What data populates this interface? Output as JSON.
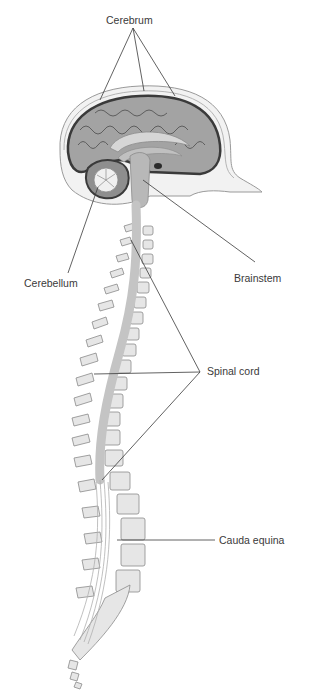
{
  "diagram": {
    "labels": {
      "cerebrum": "Cerebrum",
      "cerebellum": "Cerebellum",
      "brainstem": "Brainstem",
      "spinal_cord": "Spinal cord",
      "cauda_equina": "Cauda equina"
    },
    "colors": {
      "background": "#ffffff",
      "line": "#3a3a3a",
      "brain_gray": "#9a9a9a",
      "brain_light": "#c8c8c8",
      "bone": "#e6e6e6",
      "bone_edge": "#8a8a8a",
      "cord": "#c4c4c4"
    }
  }
}
